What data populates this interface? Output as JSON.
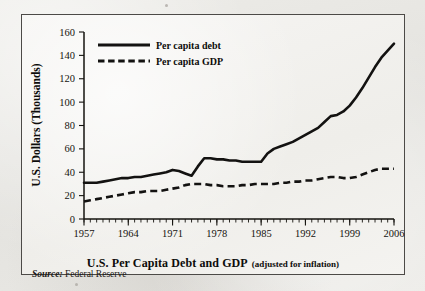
{
  "figure": {
    "caption_main": "U.S. Per Capita Debt and GDP",
    "caption_note": "(adjusted for inflation)",
    "source_label": "Source:",
    "source_value": "Federal Reserve"
  },
  "chart_data": {
    "type": "line",
    "title": "U.S. Per Capita Debt and GDP (adjusted for inflation)",
    "xlabel": "",
    "ylabel": "U.S. Dollars (Thousands)",
    "xlim": [
      1957,
      2006
    ],
    "ylim": [
      0,
      160
    ],
    "yticks": [
      0,
      20,
      40,
      60,
      80,
      100,
      120,
      140,
      160
    ],
    "xticks": [
      1957,
      1964,
      1971,
      1978,
      1985,
      1992,
      1999,
      2006
    ],
    "minor_xtick_interval": 1,
    "grid": false,
    "legend_position": "top-left-inside",
    "x": [
      1957,
      1958,
      1959,
      1960,
      1961,
      1962,
      1963,
      1964,
      1965,
      1966,
      1967,
      1968,
      1969,
      1970,
      1971,
      1972,
      1973,
      1974,
      1975,
      1976,
      1977,
      1978,
      1979,
      1980,
      1981,
      1982,
      1983,
      1984,
      1985,
      1986,
      1987,
      1988,
      1989,
      1990,
      1991,
      1992,
      1993,
      1994,
      1995,
      1996,
      1997,
      1998,
      1999,
      2000,
      2001,
      2002,
      2003,
      2004,
      2005,
      2006
    ],
    "series": [
      {
        "name": "Per capita debt",
        "style": "solid",
        "color": "#131211",
        "values": [
          31,
          31,
          31,
          32,
          33,
          34,
          35,
          35,
          36,
          36,
          37,
          38,
          39,
          40,
          42,
          41,
          39,
          37,
          45,
          52,
          52,
          51,
          51,
          50,
          50,
          49,
          49,
          49,
          49,
          56,
          60,
          62,
          64,
          66,
          69,
          72,
          75,
          78,
          83,
          88,
          89,
          92,
          97,
          104,
          112,
          121,
          130,
          138,
          144,
          150
        ]
      },
      {
        "name": "Per capita GDP",
        "style": "dashed",
        "color": "#131211",
        "values": [
          15,
          16,
          17,
          18,
          19,
          20,
          21,
          22,
          23,
          23,
          24,
          24,
          24,
          25,
          26,
          27,
          29,
          30,
          30,
          30,
          29,
          29,
          28,
          28,
          28,
          29,
          29,
          30,
          30,
          30,
          30,
          31,
          31,
          32,
          32,
          33,
          33,
          34,
          35,
          36,
          36,
          35,
          35,
          36,
          38,
          40,
          42,
          43,
          43,
          43
        ]
      }
    ]
  },
  "legend": {
    "items": [
      {
        "label": "Per capita debt",
        "style": "solid"
      },
      {
        "label": "Per capita GDP",
        "style": "dashed"
      }
    ]
  },
  "axes": {
    "y_title": "U.S. Dollars (Thousands)",
    "y_tick_labels": [
      "160",
      "140",
      "120",
      "100",
      "80",
      "60",
      "40",
      "20",
      "0"
    ],
    "x_tick_labels": [
      "1957",
      "1964",
      "1971",
      "1978",
      "1985",
      "1992",
      "1999",
      "2006"
    ]
  }
}
